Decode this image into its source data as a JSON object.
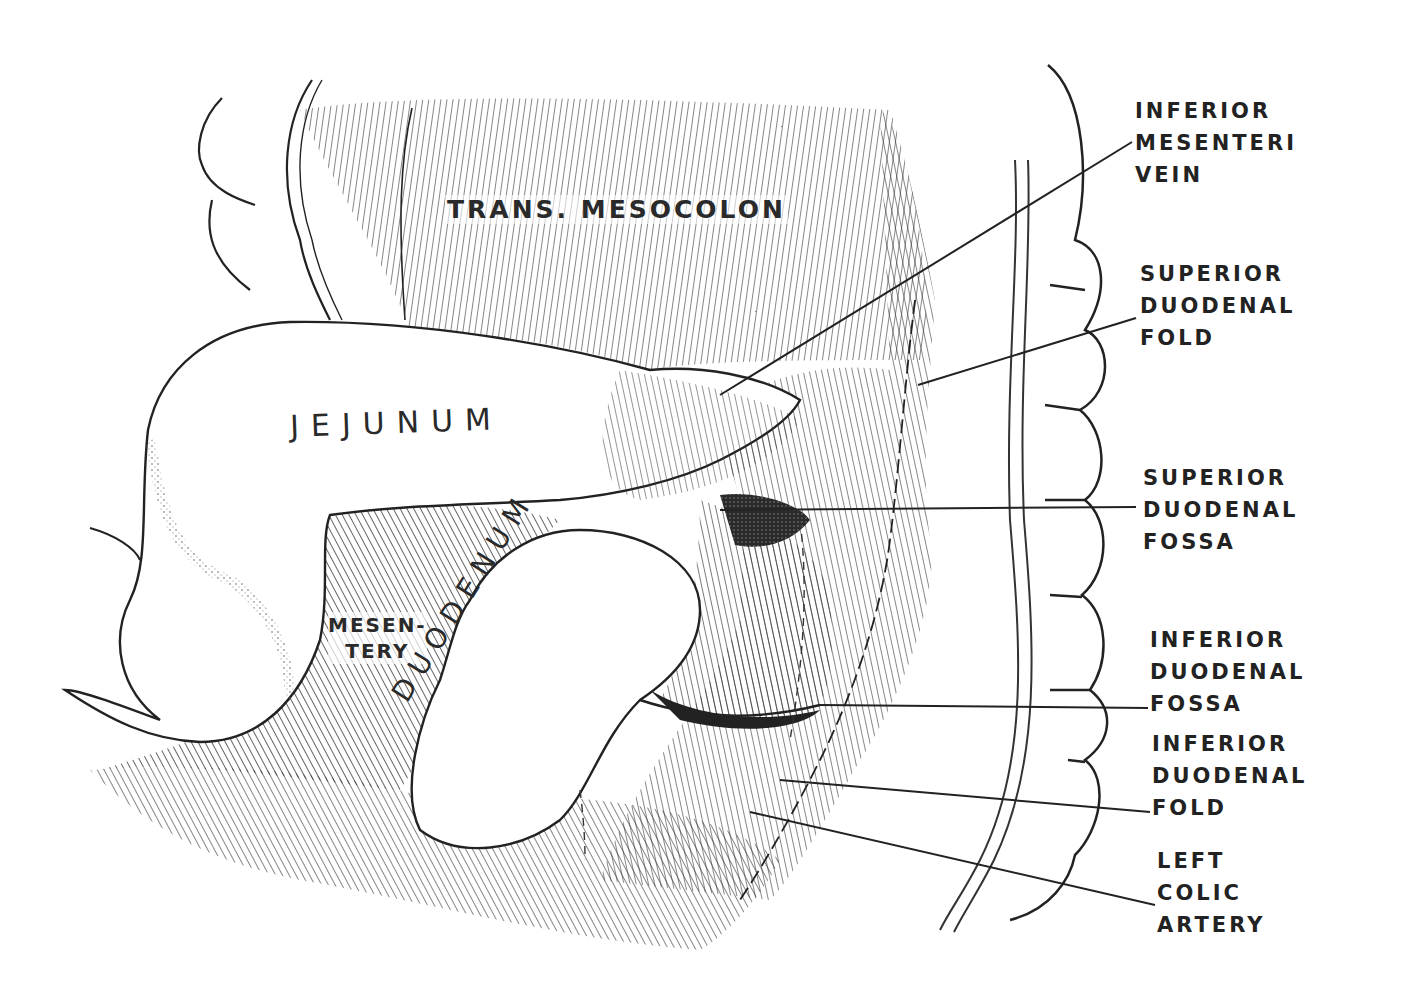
{
  "figure": {
    "ink_color": "#222222",
    "paper_color": "#ffffff"
  },
  "organ_labels": {
    "trans_mesocolon": "TRANS. MESOCOLON",
    "jejunum": "JEJUNUM",
    "mesentery_line1": "MESEN-",
    "mesentery_line2": "TERY",
    "duodenum": "DUODENUM"
  },
  "callouts": [
    {
      "lines": [
        "INFERIOR",
        "MESENTERI",
        "VEIN"
      ]
    },
    {
      "lines": [
        "SUPERIOR",
        "DUODENAL",
        "FOLD"
      ]
    },
    {
      "lines": [
        "SUPERIOR",
        "DUODENAL",
        "FOSSA"
      ]
    },
    {
      "lines": [
        "INFERIOR",
        "DUODENAL",
        "FOSSA"
      ]
    },
    {
      "lines": [
        "INFERIOR",
        "DUODENAL",
        "FOLD"
      ]
    },
    {
      "lines": [
        "LEFT",
        "COLIC",
        "ARTERY"
      ]
    }
  ]
}
